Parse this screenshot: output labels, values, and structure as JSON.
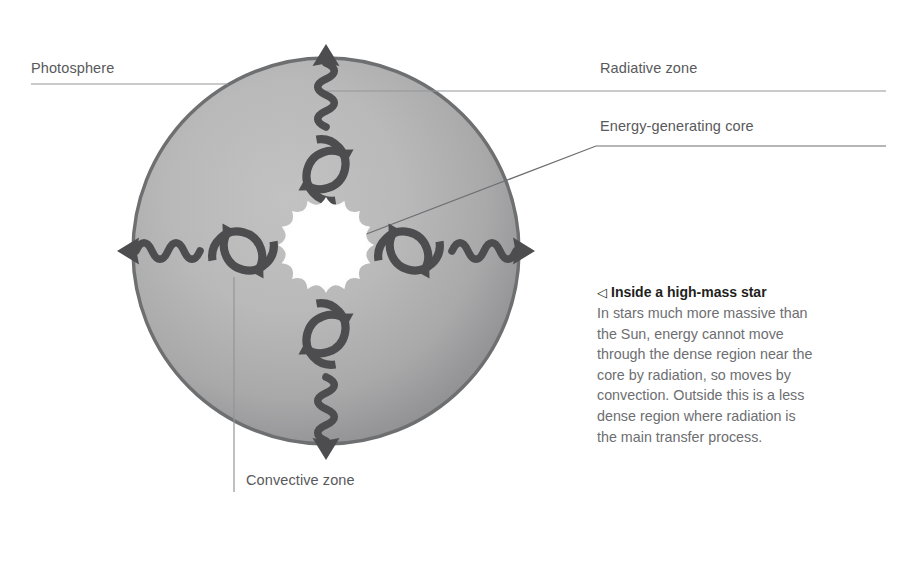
{
  "figure": {
    "subject": "Inside a high-mass star",
    "labels": {
      "photosphere": "Photosphere",
      "radiative_zone": "Radiative zone",
      "core": "Energy-generating core",
      "convective_zone": "Convective zone"
    },
    "caption": {
      "marker": "◁",
      "heading": "Inside a high-mass star",
      "body": "In stars much more massive than the Sun, energy cannot move through the dense region near the core by radiation, so moves by convection. Outside this is a less dense region where radiation is the main transfer process."
    },
    "colors": {
      "background": "#ffffff",
      "sphere_center": "#bcbcbc",
      "sphere_edge": "#8e8e90",
      "sphere_rim": "#6f7072",
      "core": "#ffffff",
      "arrow": "#4d4d4f",
      "leader_line": "#939598",
      "label_text": "#58595b",
      "caption_heading": "#231f20",
      "caption_body": "#6d6e71"
    },
    "geometry": {
      "sphere_center_x": 326,
      "sphere_center_y": 251,
      "sphere_radius": 193,
      "core_radius": 48,
      "core_points": 16
    },
    "icons": {
      "convection_loop": "circular-arrow-loop-icon",
      "radiation_ray": "wavy-arrow-icon",
      "core_burst": "starburst-icon",
      "caption_marker": "left-triangle-icon"
    }
  }
}
